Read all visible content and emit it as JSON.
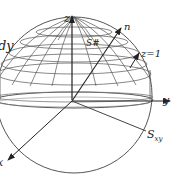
{
  "diagram": {
    "type": "3d-sphere-surface-diagram",
    "colors": {
      "stroke": "#555555",
      "axis": "#222222",
      "background": "#ffffff"
    },
    "labels": {
      "side_text": "dy",
      "z_axis": "z",
      "y_axis": "y",
      "x_axis": "x",
      "normal": "n",
      "surface": "S#",
      "plane": "z=1",
      "projection": "S",
      "projection_sub": "xy"
    }
  }
}
